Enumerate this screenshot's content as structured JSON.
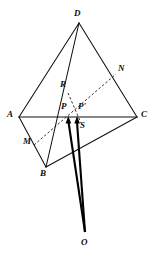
{
  "figure": {
    "kind": "geometry-diagram",
    "background_color": "#ffffff",
    "ink_color": "#111111",
    "width": 155,
    "height": 255
  },
  "labels": {
    "D": "D",
    "N": "N",
    "R": "R",
    "A": "A",
    "P": "P",
    "P_prime": "P'",
    "C": "C",
    "M": "M",
    "S": "S",
    "B": "B",
    "O": "O"
  },
  "points": [
    {
      "name": "D",
      "label": "D",
      "x": 79,
      "y": 23,
      "label_x": 74,
      "label_y": 9
    },
    {
      "name": "N",
      "label": "N",
      "x": 114,
      "y": 76,
      "label_x": 118,
      "label_y": 64
    },
    {
      "name": "R",
      "label": "R",
      "x": 69,
      "y": 92,
      "label_x": 61,
      "label_y": 80
    },
    {
      "name": "A",
      "label": "A",
      "x": 19,
      "y": 117,
      "label_x": 7,
      "label_y": 111
    },
    {
      "name": "P",
      "label": "P",
      "x": 68,
      "y": 117,
      "label_x": 62,
      "label_y": 104
    },
    {
      "name": "Pp",
      "label": "P'",
      "x": 77,
      "y": 117,
      "label_x": 79,
      "label_y": 104
    },
    {
      "name": "C",
      "label": "C",
      "x": 137,
      "y": 117,
      "label_x": 141,
      "label_y": 111
    },
    {
      "name": "M",
      "label": "M",
      "x": 37,
      "y": 141,
      "label_x": 24,
      "label_y": 138
    },
    {
      "name": "S",
      "label": "S",
      "x": 79,
      "y": 124,
      "label_x": 80,
      "label_y": 122
    },
    {
      "name": "B",
      "label": "B",
      "x": 46,
      "y": 167,
      "label_x": 41,
      "label_y": 170
    },
    {
      "name": "O",
      "label": "O",
      "x": 85,
      "y": 236,
      "label_x": 81,
      "label_y": 238
    }
  ],
  "edges": {
    "solid": [
      {
        "name": "edge-D-A",
        "from": "D",
        "to": "A"
      },
      {
        "name": "edge-D-B",
        "from": "D",
        "to": "B"
      },
      {
        "name": "edge-D-C",
        "from": "D",
        "to": "C"
      },
      {
        "name": "edge-A-B",
        "from": "A",
        "to": "B"
      },
      {
        "name": "edge-B-C",
        "from": "B",
        "to": "C"
      },
      {
        "name": "edge-A-C",
        "from": "A",
        "to": "C"
      }
    ],
    "dashed": [
      {
        "name": "dashed-M-N",
        "from": "M",
        "to": "N"
      },
      {
        "name": "dashed-R-S",
        "from": "R",
        "to": "S"
      }
    ],
    "rays": [
      {
        "name": "ray-O-P",
        "from": "O",
        "to": "P",
        "arrow": true
      },
      {
        "name": "ray-O-Pp",
        "from": "O",
        "to": "P'",
        "arrow": true
      }
    ]
  }
}
